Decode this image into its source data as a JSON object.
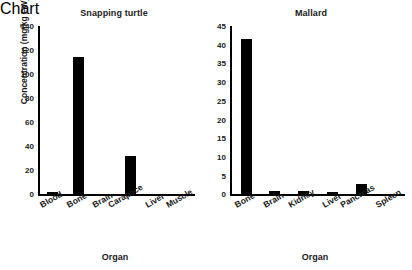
{
  "figure": {
    "background": "#ffffff",
    "bar_color": "#000000",
    "axis_color": "#000000"
  },
  "chart_data": [
    {
      "type": "bar",
      "title": "Snapping turtle",
      "xlabel": "Organ",
      "ylabel": "Concentration (mg/kg FW)",
      "categories": [
        "Blood",
        "Bone",
        "Brain",
        "Carapace",
        "Liver",
        "Muscle"
      ],
      "values": [
        2,
        114,
        0,
        32,
        0,
        0
      ],
      "ylim": [
        0,
        140
      ],
      "yticks": [
        0,
        20,
        40,
        60,
        80,
        100,
        120,
        140
      ],
      "grid": false,
      "legend": null
    },
    {
      "type": "bar",
      "title": "Mallard",
      "xlabel": "Organ",
      "ylabel": "",
      "categories": [
        "Bone",
        "Brain",
        "Kidney",
        "Liver",
        "Pancreas",
        "Spleen"
      ],
      "values": [
        41.5,
        0.8,
        0.8,
        0.6,
        2.8,
        0
      ],
      "ylim": [
        0,
        45
      ],
      "yticks": [
        0,
        5,
        10,
        15,
        20,
        25,
        30,
        35,
        40,
        45
      ],
      "grid": false,
      "legend": null
    }
  ]
}
